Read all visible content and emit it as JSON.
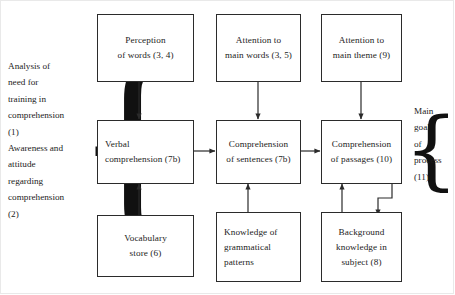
{
  "diagram": {
    "ink_color": "#2b2b2b",
    "background": "#ffffff",
    "left_annotations": {
      "block_1": [
        "Analysis of",
        "need for",
        "training in",
        "comprehension",
        "(1)"
      ],
      "block_2": [
        "Awareness and",
        "attitude",
        "regarding",
        "comprehension",
        "(2)"
      ],
      "brace": "{"
    },
    "right_annotations": {
      "block_1": [
        "Main",
        "goal",
        "of",
        "process",
        "(11)"
      ],
      "brace": "{"
    },
    "boxes": [
      {
        "id": "perception-of-words",
        "lines": [
          "Perception",
          "of words (3, 4)"
        ],
        "align": "center"
      },
      {
        "id": "attention-to-main-words",
        "lines": [
          "Attention to",
          "main words (3, 5)"
        ],
        "align": "center"
      },
      {
        "id": "attention-to-main-theme",
        "lines": [
          "Attention to",
          "main theme (9)"
        ],
        "align": "center"
      },
      {
        "id": "verbal-comprehension",
        "lines": [
          "Verbal",
          "comprehension (7b)"
        ],
        "align": "left"
      },
      {
        "id": "comprehension-of-sentences",
        "lines": [
          "Comprehension",
          "of sentences (7b)"
        ],
        "align": "center"
      },
      {
        "id": "comprehension-of-passages",
        "lines": [
          "Comprehension",
          "of passages (10)"
        ],
        "align": "center"
      },
      {
        "id": "vocabulary-store",
        "lines": [
          "Vocabulary",
          "store (6)"
        ],
        "align": "center"
      },
      {
        "id": "knowledge-grammatical",
        "lines": [
          "Knowledge of",
          "grammatical",
          "patterns"
        ],
        "align": "left"
      },
      {
        "id": "background-knowledge",
        "lines": [
          "Background",
          "knowledge in",
          "subject (8)"
        ],
        "align": "center"
      }
    ]
  }
}
